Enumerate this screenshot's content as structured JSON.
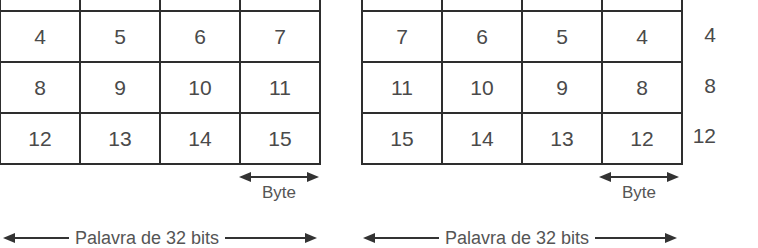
{
  "left_diagram": {
    "title": "Big endian",
    "rows": [
      [
        "0",
        "1",
        "2",
        "3"
      ],
      [
        "4",
        "5",
        "6",
        "7"
      ],
      [
        "8",
        "9",
        "10",
        "11"
      ],
      [
        "12",
        "13",
        "14",
        "15"
      ]
    ],
    "byte_label": "Byte",
    "word_label": "Palavra de 32 bits"
  },
  "right_diagram": {
    "title": "Little endian",
    "rows": [
      [
        "3",
        "2",
        "1",
        "0"
      ],
      [
        "7",
        "6",
        "5",
        "4"
      ],
      [
        "11",
        "10",
        "9",
        "8"
      ],
      [
        "15",
        "14",
        "13",
        "12"
      ]
    ],
    "row_addresses": [
      "0",
      "4",
      "8",
      "12"
    ],
    "byte_label": "Byte",
    "word_label": "Palavra de 32 bits"
  }
}
